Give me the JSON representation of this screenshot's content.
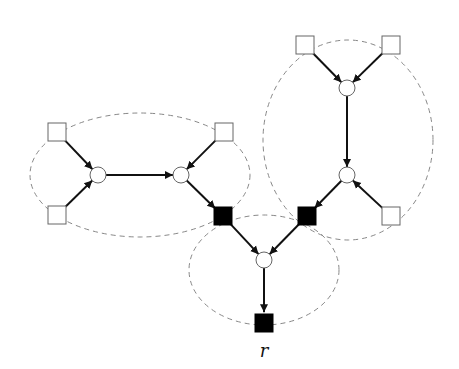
{
  "diagram": {
    "colors": {
      "edge": "#111111",
      "cluster": "#888888",
      "filled": "#000000",
      "empty": "#ffffff",
      "outline": "#666666"
    },
    "nodes": [
      {
        "id": "s1",
        "shape": "square",
        "filled": false,
        "x": 57,
        "y": 132
      },
      {
        "id": "s2",
        "shape": "square",
        "filled": false,
        "x": 57,
        "y": 215
      },
      {
        "id": "c1",
        "shape": "circle",
        "x": 98,
        "y": 175
      },
      {
        "id": "c2",
        "shape": "circle",
        "x": 181,
        "y": 175
      },
      {
        "id": "s3",
        "shape": "square",
        "filled": false,
        "x": 224,
        "y": 132
      },
      {
        "id": "f1",
        "shape": "square",
        "filled": true,
        "x": 223,
        "y": 216
      },
      {
        "id": "s4",
        "shape": "square",
        "filled": false,
        "x": 305,
        "y": 45
      },
      {
        "id": "s5",
        "shape": "square",
        "filled": false,
        "x": 391,
        "y": 45
      },
      {
        "id": "c3",
        "shape": "circle",
        "x": 347,
        "y": 88
      },
      {
        "id": "c4",
        "shape": "circle",
        "x": 347,
        "y": 175
      },
      {
        "id": "s6",
        "shape": "square",
        "filled": false,
        "x": 391,
        "y": 216
      },
      {
        "id": "f2",
        "shape": "square",
        "filled": true,
        "x": 307,
        "y": 216
      },
      {
        "id": "c5",
        "shape": "circle",
        "x": 264,
        "y": 260
      },
      {
        "id": "r",
        "shape": "square",
        "filled": true,
        "x": 264,
        "y": 323
      }
    ],
    "edges": [
      [
        "s1",
        "c1"
      ],
      [
        "s2",
        "c1"
      ],
      [
        "c1",
        "c2"
      ],
      [
        "s3",
        "c2"
      ],
      [
        "c2",
        "f1"
      ],
      [
        "s4",
        "c3"
      ],
      [
        "s5",
        "c3"
      ],
      [
        "c3",
        "c4"
      ],
      [
        "s6",
        "c4"
      ],
      [
        "c4",
        "f2"
      ],
      [
        "f1",
        "c5"
      ],
      [
        "f2",
        "c5"
      ],
      [
        "c5",
        "r"
      ]
    ],
    "clusters": [
      {
        "cx": 140,
        "cy": 175,
        "rx": 110,
        "ry": 62
      },
      {
        "cx": 348,
        "cy": 140,
        "rx": 85,
        "ry": 100
      },
      {
        "cx": 264,
        "cy": 270,
        "rx": 75,
        "ry": 55
      }
    ],
    "root_label": "r"
  }
}
